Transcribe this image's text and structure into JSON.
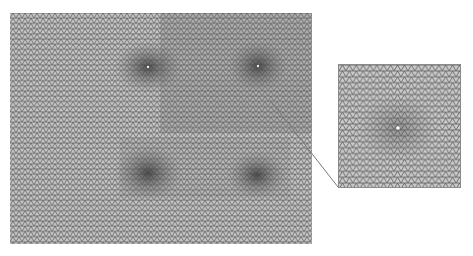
{
  "figure": {
    "main_panel": {
      "description": "triangular mesh with four local refinement zones",
      "refinement_points": [
        {
          "x": 148,
          "y": 67
        },
        {
          "x": 258,
          "y": 66
        },
        {
          "x": 148,
          "y": 173
        },
        {
          "x": 257,
          "y": 175
        }
      ],
      "mesh_color": "#4a4a4a",
      "background_color": "#d8d8d8"
    },
    "inset_panel": {
      "description": "magnified view of mesh around a refinement point",
      "center_marker_color": "#ffffff"
    },
    "leader_line": {
      "from": {
        "x": 270,
        "y": 100
      },
      "to": {
        "x": 338,
        "y": 187
      },
      "color": "#7a7a7a"
    }
  }
}
